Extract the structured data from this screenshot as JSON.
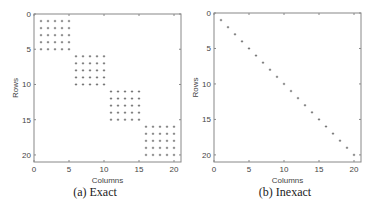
{
  "chart_data": [
    {
      "type": "scatter",
      "title": "",
      "caption": "(a) Exact",
      "xlabel": "Columns",
      "ylabel": "Rows",
      "xlim": [
        0,
        21
      ],
      "ylim": [
        21,
        0
      ],
      "y_inverted": true,
      "xticks": [
        0,
        5,
        10,
        15,
        20
      ],
      "yticks": [
        0,
        5,
        10,
        15,
        20
      ],
      "grid": false,
      "marker": "*",
      "description": "Block-diagonal sparsity pattern: four 5x5 dense blocks",
      "blocks": [
        {
          "cols": [
            1,
            5
          ],
          "rows": [
            1,
            5
          ]
        },
        {
          "cols": [
            6,
            10
          ],
          "rows": [
            6,
            10
          ]
        },
        {
          "cols": [
            11,
            15
          ],
          "rows": [
            11,
            15
          ]
        },
        {
          "cols": [
            16,
            20
          ],
          "rows": [
            16,
            20
          ]
        }
      ]
    },
    {
      "type": "scatter",
      "title": "",
      "caption": "(b) Inexact",
      "xlabel": "Columns",
      "ylabel": "Rows",
      "xlim": [
        0,
        21
      ],
      "ylim": [
        21,
        0
      ],
      "y_inverted": true,
      "xticks": [
        0,
        5,
        10,
        15,
        20
      ],
      "yticks": [
        0,
        5,
        10,
        15,
        20
      ],
      "grid": false,
      "marker": "*",
      "description": "Diagonal sparsity pattern",
      "points": [
        [
          1,
          1
        ],
        [
          2,
          2
        ],
        [
          3,
          3
        ],
        [
          4,
          4
        ],
        [
          5,
          5
        ],
        [
          6,
          6
        ],
        [
          7,
          7
        ],
        [
          8,
          8
        ],
        [
          9,
          9
        ],
        [
          10,
          10
        ],
        [
          11,
          11
        ],
        [
          12,
          12
        ],
        [
          13,
          13
        ],
        [
          14,
          14
        ],
        [
          15,
          15
        ],
        [
          16,
          16
        ],
        [
          17,
          17
        ],
        [
          18,
          18
        ],
        [
          19,
          19
        ],
        [
          20,
          20
        ]
      ]
    }
  ],
  "panels": {
    "a": {
      "caption": "(a) Exact",
      "xlabel": "Columns",
      "ylabel": "Rows",
      "ticks": [
        "0",
        "5",
        "10",
        "15",
        "20"
      ]
    },
    "b": {
      "caption": "(b) Inexact",
      "xlabel": "Columns",
      "ylabel": "Rows",
      "ticks": [
        "0",
        "5",
        "10",
        "15",
        "20"
      ]
    }
  },
  "colors": {
    "frame": "#888888",
    "marker": "#555555",
    "text": "#444444"
  }
}
